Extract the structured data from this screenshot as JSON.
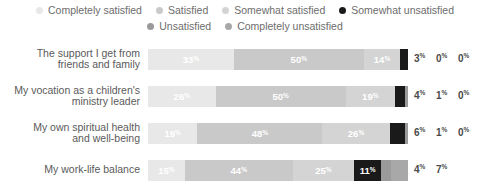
{
  "legend": {
    "rows": [
      [
        {
          "label": "Completely satisfied",
          "color": "#e8e8e8"
        },
        {
          "label": "Satisfied",
          "color": "#c9c9c9"
        },
        {
          "label": "Somewhat satisfied",
          "color": "#d4d4d4"
        },
        {
          "label": "Somewhat unsatisfied",
          "color": "#1a1a1a"
        }
      ],
      [
        {
          "label": "Unsatisfied",
          "color": "#9a9a9a"
        },
        {
          "label": "Completely unsatisfied",
          "color": "#a8a8a8"
        }
      ]
    ]
  },
  "chart_data": {
    "type": "bar",
    "title": "",
    "xlabel": "",
    "ylabel": "",
    "orientation": "horizontal",
    "stacked": true,
    "stack_total": 100,
    "unit": "%",
    "grid": false,
    "legend_position": "top",
    "categories": [
      "The support I get from friends and family",
      "My vocation as a children's ministry leader",
      "My own spiritual health and well-being",
      "My work-life balance"
    ],
    "series": [
      {
        "name": "Completely satisfied",
        "color": "#e8e8e8",
        "values": [
          33,
          26,
          19,
          15
        ]
      },
      {
        "name": "Satisfied",
        "color": "#c9c9c9",
        "values": [
          50,
          50,
          48,
          44
        ]
      },
      {
        "name": "Somewhat satisfied",
        "color": "#d4d4d4",
        "values": [
          14,
          19,
          26,
          25
        ]
      },
      {
        "name": "Somewhat unsatisfied",
        "color": "#1a1a1a",
        "values": [
          3,
          4,
          6,
          11
        ]
      },
      {
        "name": "Unsatisfied",
        "color": "#9a9a9a",
        "values": [
          0,
          1,
          1,
          4
        ]
      },
      {
        "name": "Completely unsatisfied",
        "color": "#a8a8a8",
        "values": [
          0,
          0,
          0,
          7
        ]
      }
    ]
  },
  "rows": [
    {
      "label_line1": "The support I get from",
      "label_line2": "friends and family",
      "segments": [
        {
          "name": "Completely satisfied",
          "value": 33,
          "text": "33",
          "color": "#e8e8e8",
          "inside": true
        },
        {
          "name": "Satisfied",
          "value": 50,
          "text": "50",
          "color": "#c9c9c9",
          "inside": true
        },
        {
          "name": "Somewhat satisfied",
          "value": 14,
          "text": "14",
          "color": "#d4d4d4",
          "inside": true
        },
        {
          "name": "Somewhat unsatisfied",
          "value": 3,
          "text": "3",
          "color": "#1a1a1a",
          "inside": false
        },
        {
          "name": "Unsatisfied",
          "value": 0,
          "text": "0",
          "color": "#9a9a9a",
          "inside": false
        },
        {
          "name": "Completely unsatisfied",
          "value": 0,
          "text": "0",
          "color": "#a8a8a8",
          "inside": false
        }
      ],
      "outside": [
        "3",
        "0",
        "0"
      ]
    },
    {
      "label_line1": "My vocation as a children's",
      "label_line2": "ministry leader",
      "segments": [
        {
          "name": "Completely satisfied",
          "value": 26,
          "text": "26",
          "color": "#e8e8e8",
          "inside": true
        },
        {
          "name": "Satisfied",
          "value": 50,
          "text": "50",
          "color": "#c9c9c9",
          "inside": true
        },
        {
          "name": "Somewhat satisfied",
          "value": 19,
          "text": "19",
          "color": "#d4d4d4",
          "inside": true
        },
        {
          "name": "Somewhat unsatisfied",
          "value": 4,
          "text": "4",
          "color": "#1a1a1a",
          "inside": false
        },
        {
          "name": "Unsatisfied",
          "value": 1,
          "text": "1",
          "color": "#9a9a9a",
          "inside": false
        },
        {
          "name": "Completely unsatisfied",
          "value": 0,
          "text": "0",
          "color": "#a8a8a8",
          "inside": false
        }
      ],
      "outside": [
        "4",
        "1",
        "0"
      ]
    },
    {
      "label_line1": "My own spiritual health",
      "label_line2": "and well-being",
      "segments": [
        {
          "name": "Completely satisfied",
          "value": 19,
          "text": "19",
          "color": "#e8e8e8",
          "inside": true
        },
        {
          "name": "Satisfied",
          "value": 48,
          "text": "48",
          "color": "#c9c9c9",
          "inside": true
        },
        {
          "name": "Somewhat satisfied",
          "value": 26,
          "text": "26",
          "color": "#d4d4d4",
          "inside": true
        },
        {
          "name": "Somewhat unsatisfied",
          "value": 6,
          "text": "6",
          "color": "#1a1a1a",
          "inside": false
        },
        {
          "name": "Unsatisfied",
          "value": 1,
          "text": "1",
          "color": "#9a9a9a",
          "inside": false
        },
        {
          "name": "Completely unsatisfied",
          "value": 0,
          "text": "0",
          "color": "#a8a8a8",
          "inside": false
        }
      ],
      "outside": [
        "6",
        "1",
        "0"
      ]
    },
    {
      "label_line1": "My work-life balance",
      "label_line2": "",
      "segments": [
        {
          "name": "Completely satisfied",
          "value": 15,
          "text": "15",
          "color": "#e8e8e8",
          "inside": true
        },
        {
          "name": "Satisfied",
          "value": 44,
          "text": "44",
          "color": "#c9c9c9",
          "inside": true
        },
        {
          "name": "Somewhat satisfied",
          "value": 25,
          "text": "25",
          "color": "#d4d4d4",
          "inside": true
        },
        {
          "name": "Somewhat unsatisfied",
          "value": 11,
          "text": "11",
          "color": "#1a1a1a",
          "inside": true
        },
        {
          "name": "Unsatisfied",
          "value": 4,
          "text": "4",
          "color": "#9a9a9a",
          "inside": false
        },
        {
          "name": "Completely unsatisfied",
          "value": 7,
          "text": "7",
          "color": "#a8a8a8",
          "inside": false
        }
      ],
      "outside": [
        "4",
        "7"
      ]
    }
  ]
}
